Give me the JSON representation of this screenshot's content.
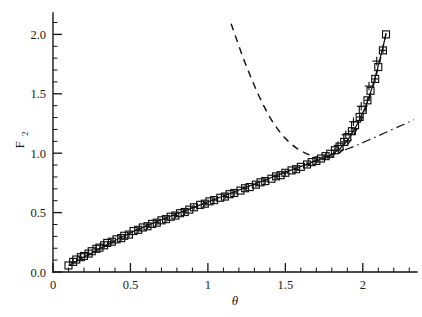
{
  "figure": {
    "background_color": "#ffffff",
    "foreground_color": "#111111"
  },
  "chart_data": {
    "type": "scatter",
    "title": "",
    "xlabel": "θ",
    "ylabel": "F",
    "ylabel_subscript": "2",
    "xlim": [
      0,
      2.35
    ],
    "ylim": [
      0,
      2.18
    ],
    "grid": false,
    "legend_position": "none",
    "x_ticks": [
      0,
      0.5,
      1,
      1.5,
      2
    ],
    "x_tick_labels": [
      "0",
      "0.5",
      "1",
      "1.5",
      "2"
    ],
    "x_minor_tick_step": 0.1,
    "y_ticks": [
      0.0,
      0.5,
      1.0,
      1.5,
      2.0
    ],
    "y_tick_labels": [
      "0.0",
      "0.5",
      "1.0",
      "1.5",
      "2.0"
    ],
    "y_minor_tick_step": 0.1,
    "series": [
      {
        "name": "open-square-data",
        "marker": "open-square",
        "linestyle": "none",
        "points": [
          [
            0.1,
            0.055
          ],
          [
            0.15,
            0.105
          ],
          [
            0.2,
            0.135
          ],
          [
            0.25,
            0.175
          ],
          [
            0.3,
            0.205
          ],
          [
            0.35,
            0.245
          ],
          [
            0.41,
            0.275
          ],
          [
            0.46,
            0.305
          ],
          [
            0.52,
            0.345
          ],
          [
            0.58,
            0.375
          ],
          [
            0.64,
            0.405
          ],
          [
            0.7,
            0.435
          ],
          [
            0.76,
            0.465
          ],
          [
            0.82,
            0.495
          ],
          [
            0.88,
            0.525
          ],
          [
            0.95,
            0.565
          ],
          [
            1.01,
            0.595
          ],
          [
            1.08,
            0.625
          ],
          [
            1.14,
            0.655
          ],
          [
            1.21,
            0.685
          ],
          [
            1.27,
            0.715
          ],
          [
            1.34,
            0.755
          ],
          [
            1.41,
            0.785
          ],
          [
            1.47,
            0.815
          ],
          [
            1.54,
            0.855
          ],
          [
            1.6,
            0.885
          ],
          [
            1.67,
            0.925
          ],
          [
            1.73,
            0.955
          ],
          [
            1.79,
            0.995
          ],
          [
            1.85,
            1.055
          ],
          [
            1.9,
            1.135
          ],
          [
            1.95,
            1.235
          ],
          [
            2.0,
            1.365
          ],
          [
            2.05,
            1.525
          ],
          [
            2.1,
            1.725
          ],
          [
            2.15,
            2.0
          ]
        ]
      },
      {
        "name": "plus-in-square-data",
        "marker": "square-with-plus",
        "linestyle": "none",
        "points": [
          [
            0.13,
            0.085
          ],
          [
            0.18,
            0.125
          ],
          [
            0.23,
            0.155
          ],
          [
            0.28,
            0.195
          ],
          [
            0.33,
            0.225
          ],
          [
            0.38,
            0.255
          ],
          [
            0.44,
            0.285
          ],
          [
            0.49,
            0.315
          ],
          [
            0.55,
            0.355
          ],
          [
            0.61,
            0.385
          ],
          [
            0.67,
            0.415
          ],
          [
            0.73,
            0.445
          ],
          [
            0.79,
            0.475
          ],
          [
            0.85,
            0.505
          ],
          [
            0.91,
            0.545
          ],
          [
            0.98,
            0.575
          ],
          [
            1.04,
            0.605
          ],
          [
            1.11,
            0.635
          ],
          [
            1.17,
            0.665
          ],
          [
            1.24,
            0.705
          ],
          [
            1.31,
            0.735
          ],
          [
            1.37,
            0.765
          ],
          [
            1.44,
            0.805
          ],
          [
            1.5,
            0.835
          ],
          [
            1.57,
            0.865
          ],
          [
            1.64,
            0.905
          ],
          [
            1.7,
            0.935
          ],
          [
            1.76,
            0.975
          ],
          [
            1.82,
            1.025
          ],
          [
            1.88,
            1.095
          ],
          [
            1.93,
            1.185
          ],
          [
            1.98,
            1.305
          ],
          [
            2.03,
            1.445
          ],
          [
            2.08,
            1.625
          ],
          [
            2.13,
            1.865
          ]
        ]
      },
      {
        "name": "plus-marker-data",
        "marker": "plus",
        "linestyle": "none",
        "points": [
          [
            1.84,
            1.065
          ],
          [
            1.89,
            1.155
          ],
          [
            1.94,
            1.265
          ],
          [
            1.99,
            1.395
          ],
          [
            2.04,
            1.565
          ],
          [
            2.09,
            1.775
          ]
        ]
      }
    ],
    "curves": [
      {
        "name": "solid-fit-curve",
        "linestyle": "solid",
        "points": [
          [
            0.1,
            0.055
          ],
          [
            0.3,
            0.195
          ],
          [
            0.5,
            0.33
          ],
          [
            0.7,
            0.44
          ],
          [
            0.9,
            0.54
          ],
          [
            1.1,
            0.64
          ],
          [
            1.3,
            0.74
          ],
          [
            1.5,
            0.84
          ],
          [
            1.65,
            0.912
          ],
          [
            1.75,
            0.962
          ],
          [
            1.82,
            1.005
          ],
          [
            1.88,
            1.075
          ],
          [
            1.93,
            1.165
          ],
          [
            1.98,
            1.285
          ],
          [
            2.03,
            1.435
          ],
          [
            2.08,
            1.64
          ],
          [
            2.12,
            1.84
          ],
          [
            2.15,
            2.0
          ]
        ]
      },
      {
        "name": "dashed-u-curve",
        "linestyle": "dashed",
        "points": [
          [
            1.15,
            2.09
          ],
          [
            1.22,
            1.83
          ],
          [
            1.29,
            1.6
          ],
          [
            1.36,
            1.4
          ],
          [
            1.43,
            1.24
          ],
          [
            1.5,
            1.125
          ],
          [
            1.57,
            1.045
          ],
          [
            1.64,
            0.995
          ],
          [
            1.71,
            0.965
          ],
          [
            1.77,
            0.96
          ],
          [
            1.83,
            0.985
          ],
          [
            1.89,
            1.055
          ],
          [
            1.95,
            1.175
          ],
          [
            2.01,
            1.345
          ],
          [
            2.06,
            1.535
          ],
          [
            2.11,
            1.775
          ],
          [
            2.15,
            2.01
          ]
        ]
      },
      {
        "name": "dash-dot-curve",
        "linestyle": "dashdot",
        "points": [
          [
            1.66,
            0.92
          ],
          [
            1.78,
            0.975
          ],
          [
            1.9,
            1.035
          ],
          [
            2.02,
            1.1
          ],
          [
            2.14,
            1.17
          ],
          [
            2.26,
            1.24
          ],
          [
            2.33,
            1.282
          ]
        ]
      }
    ]
  }
}
